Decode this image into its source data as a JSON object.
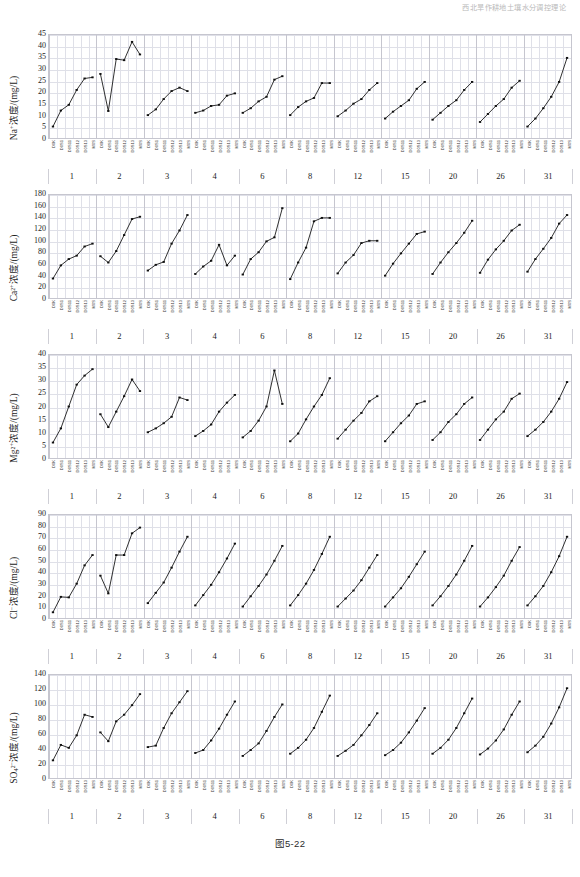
{
  "page": {
    "running_head": "西北旱作耕地土壤水分调控理论",
    "caption": "图5-22"
  },
  "axis": {
    "group_labels": [
      "1",
      "2",
      "3",
      "4",
      "6",
      "8",
      "12",
      "15",
      "20",
      "26",
      "31"
    ],
    "sample_labels": [
      "D0K",
      "D0S1",
      "D0S11",
      "D0S12",
      "D0S13",
      "M0S"
    ]
  },
  "chart_data": [
    {
      "type": "line",
      "title": "Na+ concentration",
      "ylabel": "Na⁺浓度/(mg/L)",
      "xlabel": "",
      "ylim": [
        0,
        45
      ],
      "yticks": [
        0,
        5,
        10,
        15,
        20,
        25,
        30,
        35,
        40,
        45
      ],
      "grid": true,
      "legend": "none",
      "categories": [
        "1",
        "2",
        "3",
        "4",
        "6",
        "8",
        "12",
        "15",
        "20",
        "26",
        "31"
      ],
      "x": [
        "D0K",
        "D0S1",
        "D0S11",
        "D0S12",
        "D0S13",
        "M0S"
      ],
      "series": [
        {
          "name": "1",
          "values": [
            5.0,
            12.0,
            14.5,
            21.0,
            26.0,
            26.5
          ]
        },
        {
          "name": "2",
          "values": [
            28.0,
            11.8,
            34.5,
            34.0,
            42.0,
            36.5
          ]
        },
        {
          "name": "3",
          "values": [
            10.0,
            12.5,
            17.0,
            20.5,
            22.0,
            20.5
          ]
        },
        {
          "name": "4",
          "values": [
            11.0,
            12.0,
            14.0,
            14.5,
            18.5,
            19.5
          ]
        },
        {
          "name": "6",
          "values": [
            11.0,
            13.0,
            16.0,
            18.0,
            25.5,
            27.0
          ]
        },
        {
          "name": "8",
          "values": [
            10.0,
            13.5,
            16.0,
            17.5,
            24.0,
            24.0
          ]
        },
        {
          "name": "12",
          "values": [
            9.5,
            12.0,
            15.0,
            17.0,
            21.0,
            24.0
          ]
        },
        {
          "name": "15",
          "values": [
            8.5,
            11.5,
            14.0,
            16.5,
            21.5,
            24.5
          ]
        },
        {
          "name": "20",
          "values": [
            8.0,
            11.0,
            14.0,
            16.5,
            21.0,
            24.5
          ]
        },
        {
          "name": "26",
          "values": [
            7.0,
            10.5,
            14.0,
            17.0,
            22.0,
            25.0
          ]
        },
        {
          "name": "31",
          "values": [
            5.0,
            8.5,
            13.0,
            18.0,
            24.5,
            35.0
          ]
        }
      ]
    },
    {
      "type": "line",
      "title": "Ca2+ concentration",
      "ylabel": "Ca²⁺浓度/(mg/L)",
      "xlabel": "",
      "ylim": [
        0,
        180
      ],
      "yticks": [
        0,
        20,
        40,
        60,
        80,
        100,
        120,
        140,
        160,
        180
      ],
      "grid": true,
      "legend": "none",
      "categories": [
        "1",
        "2",
        "3",
        "4",
        "6",
        "8",
        "12",
        "15",
        "20",
        "26",
        "31"
      ],
      "x": [
        "D0K",
        "D0S1",
        "D0S11",
        "D0S12",
        "D0S13",
        "M0S"
      ],
      "series": [
        {
          "name": "1",
          "values": [
            34.0,
            57.0,
            68.0,
            74.0,
            90.0,
            95.0
          ]
        },
        {
          "name": "2",
          "values": [
            73.0,
            62.0,
            82.0,
            110.0,
            138.0,
            142.0
          ]
        },
        {
          "name": "3",
          "values": [
            48.0,
            58.0,
            63.0,
            95.0,
            118.0,
            145.0
          ]
        },
        {
          "name": "4",
          "values": [
            42.0,
            55.0,
            65.0,
            93.0,
            57.0,
            74.0
          ]
        },
        {
          "name": "6",
          "values": [
            41.0,
            68.0,
            80.0,
            99.0,
            106.0,
            157.0
          ]
        },
        {
          "name": "8",
          "values": [
            33.0,
            62.0,
            88.0,
            134.0,
            140.0,
            140.0
          ]
        },
        {
          "name": "12",
          "values": [
            43.0,
            62.0,
            75.0,
            96.0,
            100.0,
            100.0
          ]
        },
        {
          "name": "15",
          "values": [
            39.0,
            60.0,
            78.0,
            95.0,
            112.0,
            116.0
          ]
        },
        {
          "name": "20",
          "values": [
            42.0,
            62.0,
            80.0,
            96.0,
            114.0,
            135.0
          ]
        },
        {
          "name": "26",
          "values": [
            44.0,
            67.0,
            85.0,
            100.0,
            118.0,
            128.0
          ]
        },
        {
          "name": "31",
          "values": [
            46.0,
            68.0,
            86.0,
            105.0,
            130.0,
            145.0
          ]
        }
      ]
    },
    {
      "type": "line",
      "title": "Mg2+ concentration",
      "ylabel": "Mg²⁺浓度/(mg/L)",
      "xlabel": "",
      "ylim": [
        0,
        40
      ],
      "yticks": [
        0,
        5,
        10,
        15,
        20,
        25,
        30,
        35,
        40
      ],
      "grid": true,
      "legend": "none",
      "categories": [
        "1",
        "2",
        "3",
        "4",
        "6",
        "8",
        "12",
        "15",
        "20",
        "26",
        "31"
      ],
      "x": [
        "D0K",
        "D0S1",
        "D0S11",
        "D0S12",
        "D0S13",
        "M0S"
      ],
      "series": [
        {
          "name": "1",
          "values": [
            6.0,
            11.5,
            20.0,
            28.5,
            32.0,
            34.5
          ]
        },
        {
          "name": "2",
          "values": [
            17.0,
            12.0,
            18.0,
            24.0,
            30.5,
            26.0
          ]
        },
        {
          "name": "3",
          "values": [
            10.0,
            11.5,
            13.5,
            16.0,
            23.5,
            22.5
          ]
        },
        {
          "name": "4",
          "values": [
            8.5,
            10.5,
            13.0,
            18.0,
            21.5,
            24.5
          ]
        },
        {
          "name": "6",
          "values": [
            8.0,
            10.5,
            14.5,
            20.0,
            34.0,
            21.0
          ]
        },
        {
          "name": "8",
          "values": [
            6.5,
            9.5,
            15.0,
            20.0,
            24.5,
            31.0
          ]
        },
        {
          "name": "12",
          "values": [
            7.5,
            11.0,
            14.5,
            17.5,
            22.0,
            24.0
          ]
        },
        {
          "name": "15",
          "values": [
            6.5,
            10.0,
            13.5,
            16.5,
            21.0,
            22.0
          ]
        },
        {
          "name": "20",
          "values": [
            7.0,
            10.0,
            14.0,
            17.0,
            21.0,
            23.5
          ]
        },
        {
          "name": "26",
          "values": [
            7.0,
            11.0,
            15.0,
            18.0,
            23.0,
            25.0
          ]
        },
        {
          "name": "31",
          "values": [
            8.5,
            11.0,
            14.0,
            18.0,
            23.0,
            29.5
          ]
        }
      ]
    },
    {
      "type": "line",
      "title": "Cl- concentration",
      "ylabel": "Cl⁻浓度/(mg/L)",
      "xlabel": "",
      "ylim": [
        0,
        90
      ],
      "yticks": [
        0,
        10,
        20,
        30,
        40,
        50,
        60,
        70,
        80,
        90
      ],
      "grid": true,
      "legend": "none",
      "categories": [
        "1",
        "2",
        "3",
        "4",
        "6",
        "8",
        "12",
        "15",
        "20",
        "26",
        "31"
      ],
      "x": [
        "D0K",
        "D0S1",
        "D0S11",
        "D0S12",
        "D0S13",
        "M0S"
      ],
      "series": [
        {
          "name": "1",
          "values": [
            5.0,
            18.5,
            18.0,
            30.0,
            46.0,
            55.0
          ]
        },
        {
          "name": "2",
          "values": [
            37.0,
            21.5,
            55.0,
            55.0,
            74.0,
            79.0
          ]
        },
        {
          "name": "3",
          "values": [
            13.0,
            22.0,
            31.0,
            44.0,
            58.0,
            71.0
          ]
        },
        {
          "name": "4",
          "values": [
            11.0,
            20.0,
            29.0,
            40.0,
            52.0,
            65.0
          ]
        },
        {
          "name": "6",
          "values": [
            10.0,
            19.0,
            28.0,
            38.0,
            50.0,
            63.0
          ]
        },
        {
          "name": "8",
          "values": [
            11.0,
            20.0,
            30.0,
            42.0,
            56.0,
            71.0
          ]
        },
        {
          "name": "12",
          "values": [
            10.0,
            17.0,
            24.0,
            33.0,
            44.0,
            55.0
          ]
        },
        {
          "name": "15",
          "values": [
            10.0,
            18.0,
            26.0,
            36.0,
            47.0,
            58.0
          ]
        },
        {
          "name": "20",
          "values": [
            11.0,
            19.0,
            28.0,
            38.0,
            50.0,
            63.0
          ]
        },
        {
          "name": "26",
          "values": [
            10.0,
            18.0,
            27.0,
            37.0,
            50.0,
            62.0
          ]
        },
        {
          "name": "31",
          "values": [
            11.0,
            19.0,
            28.0,
            40.0,
            54.0,
            71.0
          ]
        }
      ]
    },
    {
      "type": "line",
      "title": "SO4 2- concentration",
      "ylabel": "SO₄²⁻浓度/(mg/L)",
      "xlabel": "",
      "ylim": [
        0,
        140
      ],
      "yticks": [
        0,
        20,
        40,
        60,
        80,
        100,
        120,
        140
      ],
      "grid": true,
      "legend": "none",
      "categories": [
        "1",
        "2",
        "3",
        "4",
        "6",
        "8",
        "12",
        "15",
        "20",
        "26",
        "31"
      ],
      "x": [
        "D0K",
        "D0S1",
        "D0S11",
        "D0S12",
        "D0S13",
        "M0S"
      ],
      "series": [
        {
          "name": "1",
          "values": [
            24.0,
            45.0,
            41.0,
            58.0,
            86.0,
            83.0
          ]
        },
        {
          "name": "2",
          "values": [
            62.0,
            50.0,
            77.0,
            86.0,
            99.0,
            114.0
          ]
        },
        {
          "name": "3",
          "values": [
            42.0,
            44.0,
            68.0,
            88.0,
            103.0,
            118.0
          ]
        },
        {
          "name": "4",
          "values": [
            34.0,
            38.0,
            51.0,
            67.0,
            86.0,
            104.0
          ]
        },
        {
          "name": "6",
          "values": [
            30.0,
            38.0,
            47.0,
            64.0,
            83.0,
            100.0
          ]
        },
        {
          "name": "8",
          "values": [
            33.0,
            41.0,
            52.0,
            68.0,
            90.0,
            112.0
          ]
        },
        {
          "name": "12",
          "values": [
            30.0,
            37.0,
            45.0,
            58.0,
            72.0,
            88.0
          ]
        },
        {
          "name": "15",
          "values": [
            31.0,
            38.0,
            48.0,
            62.0,
            78.0,
            95.0
          ]
        },
        {
          "name": "20",
          "values": [
            33.0,
            41.0,
            52.0,
            68.0,
            88.0,
            108.0
          ]
        },
        {
          "name": "26",
          "values": [
            32.0,
            40.0,
            51.0,
            66.0,
            86.0,
            104.0
          ]
        },
        {
          "name": "31",
          "values": [
            35.0,
            44.0,
            56.0,
            74.0,
            96.0,
            122.0
          ]
        }
      ]
    }
  ]
}
